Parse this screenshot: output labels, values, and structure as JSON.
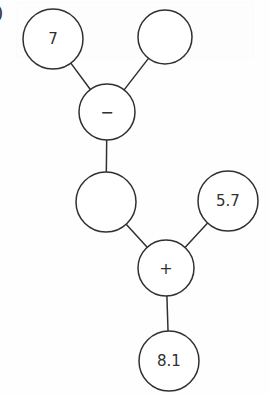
{
  "figure": {
    "type": "expression-tree",
    "label_fragment": ")",
    "background_color": "#fefefe",
    "stroke_color": "#303030",
    "text_color": "#303030"
  },
  "nodes": [
    {
      "id": "n-seven",
      "label": "7",
      "cx": 53,
      "cy": 39,
      "r": 30,
      "empty": false
    },
    {
      "id": "n-empty-top",
      "label": "",
      "cx": 165,
      "cy": 37,
      "r": 27,
      "empty": true
    },
    {
      "id": "n-minus",
      "label": "−",
      "cx": 107,
      "cy": 112,
      "r": 28,
      "empty": false
    },
    {
      "id": "n-empty-mid",
      "label": "",
      "cx": 106,
      "cy": 202,
      "r": 30,
      "empty": true
    },
    {
      "id": "n-five-seven",
      "label": "5.7",
      "cx": 228,
      "cy": 201,
      "r": 30,
      "empty": false
    },
    {
      "id": "n-plus",
      "label": "+",
      "cx": 166,
      "cy": 268,
      "r": 28,
      "empty": false
    },
    {
      "id": "n-eight-one",
      "label": "8.1",
      "cx": 169,
      "cy": 361,
      "r": 30,
      "empty": false
    }
  ],
  "edges": [
    {
      "id": "e-seven-minus",
      "from": "n-seven",
      "to": "n-minus"
    },
    {
      "id": "e-emptytop-minus",
      "from": "n-empty-top",
      "to": "n-minus"
    },
    {
      "id": "e-minus-emptymid",
      "from": "n-minus",
      "to": "n-empty-mid"
    },
    {
      "id": "e-emptymid-plus",
      "from": "n-empty-mid",
      "to": "n-plus"
    },
    {
      "id": "e-fiveseven-plus",
      "from": "n-five-seven",
      "to": "n-plus"
    },
    {
      "id": "e-plus-eightone",
      "from": "n-plus",
      "to": "n-eight-one"
    }
  ],
  "style": {
    "node_stroke_width": 1.5,
    "edge_stroke_width": 1.5,
    "label_font_size": 15,
    "operator_font_size": 16
  }
}
